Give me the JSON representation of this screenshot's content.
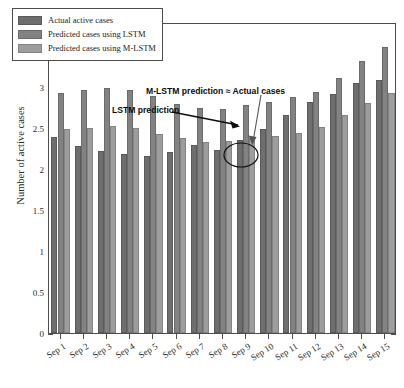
{
  "figure": {
    "exponent_label": "×10",
    "exponent_power": "4",
    "ylabel": "Number of active cases",
    "background_color": "#ffffff",
    "axis_color": "#4d4d4d"
  },
  "legend": {
    "position": "top-left-inside",
    "entries": [
      {
        "label": "Actual active cases",
        "color": "#6e6e6e"
      },
      {
        "label": "Predicted cases using LSTM",
        "color": "#828282"
      },
      {
        "label": "Predicted cases using M-LSTM",
        "color": "#9d9d9d"
      }
    ]
  },
  "annotations": [
    {
      "name": "mlstm-actual-annotation",
      "text": "M-LSTM prediction ≈ Actual cases"
    },
    {
      "name": "lstm-annotation",
      "text": "LSTM prediction"
    }
  ],
  "chart_data": {
    "type": "bar",
    "title": "",
    "subtitle": "",
    "xlabel": "",
    "ylabel": "Number of active cases",
    "y_multiplier": "×10^4",
    "ylim": [
      0,
      38000
    ],
    "ytick_labels": [
      "0",
      "0.5",
      "1",
      "1.5",
      "2",
      "2.5",
      "3",
      "3.5"
    ],
    "ytick_values": [
      0,
      5000,
      10000,
      15000,
      20000,
      25000,
      30000,
      35000
    ],
    "grid": false,
    "legend_position": "upper left",
    "categories": [
      "Sep 1",
      "Sep 2",
      "Sep 3",
      "Sep 4",
      "Sep 5",
      "Sep 6",
      "Sep 7",
      "Sep 8",
      "Sep 9",
      "Sep 10",
      "Sep 11",
      "Sep 12",
      "Sep 13",
      "Sep 14",
      "Sep 15"
    ],
    "series": [
      {
        "name": "Actual active cases",
        "color": "#6e6e6e",
        "values": [
          23900,
          22900,
          22300,
          21900,
          21600,
          22100,
          23000,
          22400,
          23600,
          24900,
          26600,
          28200,
          29200,
          30500,
          30900
        ]
      },
      {
        "name": "Predicted cases using LSTM",
        "color": "#828282",
        "values": [
          29300,
          29700,
          29900,
          29700,
          29000,
          28000,
          27500,
          27400,
          27800,
          28200,
          28800,
          29500,
          31100,
          33200,
          35000
        ]
      },
      {
        "name": "Predicted cases using M-LSTM",
        "color": "#9d9d9d",
        "values": [
          24900,
          25100,
          25300,
          25000,
          24300,
          23800,
          23400,
          23500,
          23800,
          24100,
          24500,
          25200,
          26600,
          28100,
          29300
        ]
      }
    ],
    "annotations": [
      {
        "text": "M-LSTM prediction ≈ Actual cases",
        "points_to": "Sep 9"
      },
      {
        "text": "LSTM prediction",
        "points_to": "Sep 9"
      },
      {
        "shape": "ellipse",
        "highlights": "Sep 9 actual and M-LSTM bar tops"
      }
    ]
  }
}
